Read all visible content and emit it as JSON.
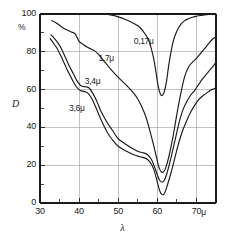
{
  "chart_data": {
    "type": "line",
    "title": "",
    "xlabel": "λ",
    "ylabel": "D",
    "x_unit": "μ",
    "y_unit": "%",
    "xlim": [
      30,
      75
    ],
    "ylim": [
      0,
      100
    ],
    "xticks": [
      30,
      40,
      50,
      60,
      70
    ],
    "xtick_labels": [
      "30",
      "40",
      "50",
      "60",
      "70"
    ],
    "yticks": [
      0,
      20,
      40,
      60,
      80,
      100
    ],
    "ytick_labels": [
      "0",
      "20",
      "40",
      "60",
      "80",
      "100"
    ],
    "x_minor_ticks": [
      35,
      45,
      55,
      65
    ],
    "y_minor_ticks": [
      10,
      30,
      50,
      70,
      90
    ],
    "grid": true,
    "grid_color": "#999999",
    "line_color": "#1a1a1a",
    "legend_position": "inline-labels",
    "series": [
      {
        "name": "0,17μ",
        "label": "0,17μ",
        "label_x": 56.5,
        "label_y": 85,
        "x": [
          38.5,
          40,
          42,
          44,
          46,
          48,
          50,
          52,
          54,
          55.5,
          57,
          58,
          59,
          59.6,
          60.2,
          60.8,
          61.3,
          61.8,
          62.4,
          63,
          64,
          65,
          66,
          67,
          68,
          69,
          70,
          71,
          72,
          73,
          74,
          75
        ],
        "y": [
          100,
          100,
          100,
          100,
          100,
          99.5,
          98.5,
          97,
          95,
          93,
          89,
          85,
          77,
          70,
          62,
          57.5,
          57,
          59,
          65,
          74,
          85,
          91,
          94.5,
          96.5,
          97.5,
          98.3,
          98.8,
          99.2,
          99.5,
          99.8,
          100,
          100
        ]
      },
      {
        "name": "1,7μ",
        "label": "1,7μ",
        "label_x": 47.5,
        "label_y": 76,
        "x": [
          33,
          34,
          35,
          36,
          37,
          38,
          39,
          40,
          41,
          42,
          43,
          44,
          45,
          46,
          47,
          48,
          50,
          52,
          54,
          55,
          56,
          57,
          58,
          59,
          59.8,
          60.4,
          61,
          61.6,
          62.2,
          63,
          64,
          65,
          66,
          67,
          68,
          69,
          70,
          71,
          72,
          73,
          74,
          75
        ],
        "y": [
          96.5,
          95.5,
          94,
          92.5,
          91.5,
          90.5,
          89.5,
          85.5,
          84,
          82.5,
          81.5,
          80.5,
          78.5,
          76,
          73.5,
          71,
          66.5,
          62.5,
          58,
          55,
          51,
          46,
          39,
          31,
          24,
          19,
          16.5,
          16.5,
          19,
          25,
          35,
          47,
          58,
          67,
          72,
          74.5,
          76.5,
          79,
          81.5,
          84,
          86.5,
          88
        ]
      },
      {
        "name": "3,4μ",
        "label": "3,4μ",
        "label_x": 44,
        "label_y": 64,
        "x": [
          32.8,
          33.5,
          34.5,
          35.5,
          36.5,
          37.5,
          38.5,
          39.5,
          40.5,
          41.5,
          42.5,
          43.5,
          44.5,
          45.5,
          46.5,
          47.5,
          48.5,
          50,
          52,
          54,
          55.5,
          56.5,
          57.5,
          58.5,
          59.3,
          60,
          60.6,
          61.2,
          61.8,
          62.5,
          63.5,
          64.5,
          65.5,
          66.5,
          67.5,
          68.5,
          69.5,
          70.5,
          71.5,
          72.5,
          73.5,
          74.5,
          75
        ],
        "y": [
          89,
          87.5,
          85,
          81.5,
          77,
          72.5,
          68.5,
          64.5,
          62,
          61.5,
          61,
          58,
          54,
          49,
          45,
          41.5,
          38.5,
          34,
          31,
          28.5,
          27,
          26.5,
          25.5,
          23,
          19,
          15,
          12,
          11,
          12,
          16,
          24,
          33,
          42,
          49,
          53.5,
          57,
          59.5,
          62.5,
          65.5,
          68,
          70.5,
          73,
          74.5
        ]
      },
      {
        "name": "3,6μ",
        "label": "3,6μ",
        "label_x": 40,
        "label_y": 50,
        "x": [
          32.6,
          33.3,
          34.3,
          35.3,
          36.3,
          37.3,
          38.3,
          39.3,
          40.3,
          41.3,
          42.3,
          43.3,
          44.3,
          45.3,
          46.3,
          47.3,
          48.3,
          50,
          52,
          54,
          55.5,
          56.5,
          57.5,
          58.5,
          59.3,
          60,
          60.6,
          61.2,
          61.8,
          62.5,
          63.5,
          64.5,
          65.5,
          66.5,
          67.5,
          68.5,
          69.5,
          70.5,
          71.5,
          72.5,
          73.5,
          74.5,
          75
        ],
        "y": [
          87,
          85,
          82,
          78,
          73.5,
          69,
          65,
          61.5,
          59.5,
          59,
          58,
          55,
          50.5,
          45.5,
          41,
          37,
          34,
          30,
          27.5,
          25.5,
          24.5,
          24,
          23,
          20.5,
          16.5,
          11,
          6.5,
          4.5,
          5,
          9,
          16,
          24,
          32,
          38.5,
          43.5,
          48,
          51.5,
          54.5,
          56.5,
          58,
          59.5,
          60.5,
          61
        ]
      }
    ]
  },
  "axes": {
    "y_unit_label": "%",
    "y_title": "D",
    "x_title": "λ",
    "x_unit_label": "μ"
  }
}
